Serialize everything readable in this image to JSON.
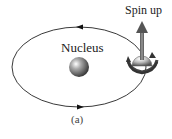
{
  "figure": {
    "caption": "(a)",
    "labels": {
      "nucleus": "Nucleus",
      "spin": "Spin up"
    },
    "elements": {
      "orbit": {
        "shape": "ellipse",
        "direction": "counterclockwise-top-left"
      },
      "nucleus": {
        "shape": "sphere",
        "color": "#555555"
      },
      "electron": {
        "shape": "spinning-sphere",
        "color": "#888888",
        "spin_arrow_color": "#666666"
      }
    }
  }
}
